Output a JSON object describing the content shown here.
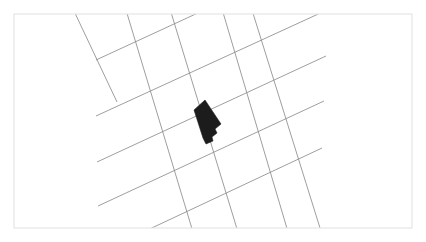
{
  "figure": {
    "name": "building-footprint-map",
    "title": "Building footprint on rotated cadastral street grid",
    "width": 426,
    "height": 242,
    "background_color": "#ffffff"
  },
  "frame": {
    "name": "map-border-frame",
    "x": 14,
    "y": 14,
    "width": 398,
    "height": 214,
    "stroke_color": "#e3e3e3",
    "stroke_width": 1.1,
    "fill_color": "#ffffff"
  },
  "grid": {
    "description": "Two families of straight parcel/street lines crossing at near right angles, rotated about 25 degrees from horizontal",
    "stroke_color": "#8d8d8d",
    "stroke_width": 0.85,
    "family_a": {
      "label": "northeast-trending-lines",
      "bearing_deg": -25,
      "count": 5,
      "lines": [
        {
          "x1": 96,
          "y1": 60,
          "x2": 330,
          "y2": -48
        },
        {
          "x1": 96,
          "y1": 116,
          "x2": 327,
          "y2": 10
        },
        {
          "x1": 97,
          "y1": 162,
          "x2": 326,
          "y2": 56
        },
        {
          "x1": 98,
          "y1": 206,
          "x2": 324,
          "y2": 101
        },
        {
          "x1": 122,
          "y1": 242,
          "x2": 322,
          "y2": 148
        }
      ]
    },
    "family_b": {
      "label": "southeast-trending-lines",
      "bearing_deg": 64,
      "count": 5,
      "lines": [
        {
          "x1": 74,
          "y1": 11,
          "x2": 117,
          "y2": 102
        },
        {
          "x1": 126,
          "y1": 10,
          "x2": 196,
          "y2": 242
        },
        {
          "x1": 170,
          "y1": 9,
          "x2": 241,
          "y2": 242
        },
        {
          "x1": 222,
          "y1": 9,
          "x2": 291,
          "y2": 242
        },
        {
          "x1": 252,
          "y1": 10,
          "x2": 320,
          "y2": 228
        }
      ]
    }
  },
  "building": {
    "name": "building-footprint",
    "fill_color": "#1c1c1c",
    "shape": "irregular-rotated-rectangle-with-notch",
    "bounding_box": {
      "x": 190,
      "y": 99,
      "width": 31,
      "height": 45
    },
    "points": "194,110 205,100 221,124 215,129 217,133 212,137 213,141 206,144 203,138"
  },
  "legend": {
    "visible": false,
    "items": []
  },
  "labels": {
    "visible": false,
    "items": []
  },
  "chart_data": {
    "type": "map",
    "title": "Building footprint on rotated cadastral street grid",
    "xlabel": "",
    "ylabel": "",
    "grid": true,
    "legend_position": "none",
    "features": [
      {
        "name": "street-grid",
        "geometry": "lines",
        "count": 10,
        "color": "#8d8d8d"
      },
      {
        "name": "building-footprint",
        "geometry": "polygon",
        "count": 1,
        "color": "#1c1c1c"
      }
    ]
  }
}
